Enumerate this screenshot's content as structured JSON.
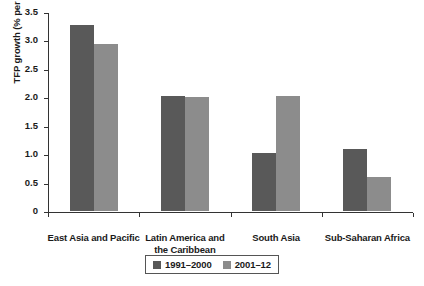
{
  "chart_data": {
    "type": "bar",
    "title": "",
    "subtitle": "",
    "xlabel": "",
    "ylabel": "TFP growth (% per year)",
    "ylim": [
      0,
      3.5
    ],
    "yticks": [
      0,
      0.5,
      1.0,
      1.5,
      2.0,
      2.5,
      3.0,
      3.5
    ],
    "ytick_labels": [
      "0",
      "0.5",
      "1.0",
      "1.5",
      "2.0",
      "2.5",
      "3.0",
      "3.5"
    ],
    "grid": false,
    "legend_position": "bottom-center",
    "categories": [
      "East Asia and Pacific",
      "Latin America and the Caribbean",
      "South Asia",
      "Sub-Saharan Africa"
    ],
    "category_label_lines": [
      [
        "East Asia and Pacific"
      ],
      [
        "Latin America and",
        "the Caribbean"
      ],
      [
        "South Asia"
      ],
      [
        "Sub-Saharan Africa"
      ]
    ],
    "series": [
      {
        "name": "1991–2000",
        "color": "#595959",
        "values": [
          3.27,
          2.02,
          1.02,
          1.1
        ]
      },
      {
        "name": "2001–12",
        "color": "#8c8c8c",
        "values": [
          2.93,
          2.0,
          2.03,
          0.6
        ]
      }
    ]
  },
  "legend": {
    "items": [
      {
        "label": "1991–2000",
        "swatch": "#595959"
      },
      {
        "label": "2001–12",
        "swatch": "#8c8c8c"
      }
    ]
  }
}
